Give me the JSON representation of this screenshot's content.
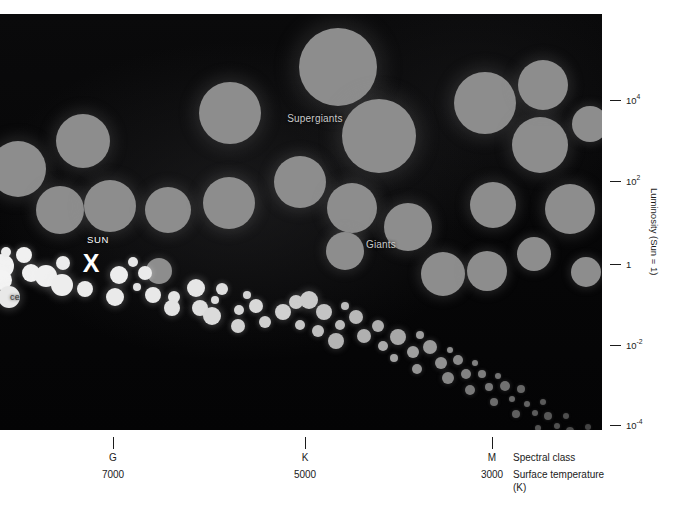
{
  "figure": {
    "background_color": "#050505",
    "page_background": "#ffffff"
  },
  "annotations": {
    "supergiants": "Supergiants",
    "giants": "Giants",
    "sun": "SUN",
    "sun_marker": "X",
    "main_sequence_clipped": "ce"
  },
  "y_axis": {
    "title": "Luminosity (Sun = 1)",
    "ticks": [
      {
        "label": "10",
        "exponent": "4",
        "y": 100
      },
      {
        "label": "10",
        "exponent": "2",
        "y": 181
      },
      {
        "label": "1",
        "exponent": "",
        "y": 264
      },
      {
        "label": "10",
        "exponent": "-2",
        "y": 345
      },
      {
        "label": "10",
        "exponent": "-4",
        "y": 425
      }
    ]
  },
  "x_axis": {
    "class_title": "Spectral class",
    "temp_title": "Surface temperature",
    "temp_unit": "(K)",
    "ticks": [
      {
        "spectral_class": "G",
        "temperature": "7000",
        "x": 113
      },
      {
        "spectral_class": "K",
        "temperature": "5000",
        "x": 305
      },
      {
        "spectral_class": "M",
        "temperature": "3000",
        "x": 492
      }
    ]
  },
  "chart_data": {
    "type": "scatter",
    "xlabel": "Spectral class / Surface temperature (K)",
    "ylabel": "Luminosity (Sun = 1)",
    "grid": false,
    "legend": "none",
    "x_tick_labels": [
      "G",
      "K",
      "M"
    ],
    "x_tick_temperatures": [
      7000,
      5000,
      3000
    ],
    "y_tick_labels": [
      "10^4",
      "10^2",
      "1",
      "10^-2",
      "10^-4"
    ],
    "series": [
      {
        "name": "Supergiants and Giants",
        "color": "#8d8d8d",
        "marker": "circle",
        "note": "Large grey discs in the upper half of the diagram; disc radius encodes stellar radius.",
        "points": [
          {
            "cx": 18,
            "cy": 155,
            "r": 28
          },
          {
            "cx": 83,
            "cy": 127,
            "r": 27
          },
          {
            "cx": 60,
            "cy": 196,
            "r": 24
          },
          {
            "cx": 110,
            "cy": 192,
            "r": 26
          },
          {
            "cx": 168,
            "cy": 196,
            "r": 23
          },
          {
            "cx": 230,
            "cy": 99,
            "r": 31
          },
          {
            "cx": 229,
            "cy": 189,
            "r": 26
          },
          {
            "cx": 159,
            "cy": 257,
            "r": 13
          },
          {
            "cx": 300,
            "cy": 168,
            "r": 26
          },
          {
            "cx": 338,
            "cy": 53,
            "r": 39
          },
          {
            "cx": 379,
            "cy": 122,
            "r": 37
          },
          {
            "cx": 352,
            "cy": 194,
            "r": 25
          },
          {
            "cx": 345,
            "cy": 237,
            "r": 19
          },
          {
            "cx": 408,
            "cy": 213,
            "r": 24
          },
          {
            "cx": 443,
            "cy": 260,
            "r": 22
          },
          {
            "cx": 485,
            "cy": 89,
            "r": 31
          },
          {
            "cx": 493,
            "cy": 191,
            "r": 23
          },
          {
            "cx": 487,
            "cy": 257,
            "r": 20
          },
          {
            "cx": 540,
            "cy": 131,
            "r": 28
          },
          {
            "cx": 543,
            "cy": 71,
            "r": 25
          },
          {
            "cx": 570,
            "cy": 195,
            "r": 25
          },
          {
            "cx": 534,
            "cy": 240,
            "r": 17
          },
          {
            "cx": 586,
            "cy": 258,
            "r": 15
          },
          {
            "cx": 590,
            "cy": 110,
            "r": 18
          }
        ]
      },
      {
        "name": "Main sequence",
        "color": "#efefef",
        "marker": "circle",
        "note": "Bright band of stars running from upper-left (hot, luminous) to lower-right (cool, faint); discs shrink and dim along the sequence.",
        "points": [
          {
            "cx": 2,
            "cy": 252,
            "r": 12,
            "c": "#f2f2f2"
          },
          {
            "cx": 6,
            "cy": 238,
            "r": 5,
            "c": "#ededed"
          },
          {
            "cx": 24,
            "cy": 241,
            "r": 8,
            "c": "#f0f0f0"
          },
          {
            "cx": 2,
            "cy": 266,
            "r": 10,
            "c": "#f4f4f4"
          },
          {
            "cx": 31,
            "cy": 259,
            "r": 9,
            "c": "#f1f1f1"
          },
          {
            "cx": 9,
            "cy": 283,
            "r": 11,
            "c": "#e8e8e8"
          },
          {
            "cx": 46,
            "cy": 262,
            "r": 11,
            "c": "#f0f0f0"
          },
          {
            "cx": 63,
            "cy": 249,
            "r": 7,
            "c": "#ececec"
          },
          {
            "cx": 62,
            "cy": 271,
            "r": 11,
            "c": "#ededed"
          },
          {
            "cx": 85,
            "cy": 275,
            "r": 8,
            "c": "#ebebeb"
          },
          {
            "cx": 119,
            "cy": 261,
            "r": 9,
            "c": "#ededed"
          },
          {
            "cx": 133,
            "cy": 248,
            "r": 5,
            "c": "#e7e7e7"
          },
          {
            "cx": 145,
            "cy": 259,
            "r": 7,
            "c": "#ebebeb"
          },
          {
            "cx": 137,
            "cy": 273,
            "r": 4,
            "c": "#e2e2e2"
          },
          {
            "cx": 115,
            "cy": 283,
            "r": 9,
            "c": "#eaeaea"
          },
          {
            "cx": 153,
            "cy": 281,
            "r": 8,
            "c": "#e8e8e8"
          },
          {
            "cx": 174,
            "cy": 283,
            "r": 6,
            "c": "#e4e4e4"
          },
          {
            "cx": 172,
            "cy": 294,
            "r": 8,
            "c": "#e3e3e3"
          },
          {
            "cx": 196,
            "cy": 274,
            "r": 9,
            "c": "#e6e6e6"
          },
          {
            "cx": 200,
            "cy": 294,
            "r": 8,
            "c": "#e0e0e0"
          },
          {
            "cx": 215,
            "cy": 286,
            "r": 4,
            "c": "#dcdcdc"
          },
          {
            "cx": 222,
            "cy": 275,
            "r": 6,
            "c": "#dedede"
          },
          {
            "cx": 212,
            "cy": 302,
            "r": 9,
            "c": "#dbdbdb"
          },
          {
            "cx": 239,
            "cy": 296,
            "r": 5,
            "c": "#d6d6d6"
          },
          {
            "cx": 247,
            "cy": 281,
            "r": 4,
            "c": "#d4d4d4"
          },
          {
            "cx": 256,
            "cy": 292,
            "r": 7,
            "c": "#d8d8d8"
          },
          {
            "cx": 238,
            "cy": 312,
            "r": 7,
            "c": "#d2d2d2"
          },
          {
            "cx": 265,
            "cy": 308,
            "r": 6,
            "c": "#cfcfcf"
          },
          {
            "cx": 283,
            "cy": 298,
            "r": 8,
            "c": "#d0d0d0"
          },
          {
            "cx": 296,
            "cy": 288,
            "r": 7,
            "c": "#cdcdcd"
          },
          {
            "cx": 309,
            "cy": 286,
            "r": 9,
            "c": "#cacaca"
          },
          {
            "cx": 300,
            "cy": 311,
            "r": 5,
            "c": "#c6c6c6"
          },
          {
            "cx": 324,
            "cy": 298,
            "r": 8,
            "c": "#c4c4c4"
          },
          {
            "cx": 318,
            "cy": 317,
            "r": 6,
            "c": "#bfbfbf"
          },
          {
            "cx": 340,
            "cy": 311,
            "r": 5,
            "c": "#bbbbbb"
          },
          {
            "cx": 345,
            "cy": 292,
            "r": 4,
            "c": "#bcbcbc"
          },
          {
            "cx": 356,
            "cy": 303,
            "r": 7,
            "c": "#b8b8b8"
          },
          {
            "cx": 336,
            "cy": 327,
            "r": 8,
            "c": "#b4b4b4"
          },
          {
            "cx": 364,
            "cy": 322,
            "r": 7,
            "c": "#b0b0b0"
          },
          {
            "cx": 378,
            "cy": 312,
            "r": 6,
            "c": "#aeaeae"
          },
          {
            "cx": 383,
            "cy": 332,
            "r": 5,
            "c": "#aaaaaa"
          },
          {
            "cx": 398,
            "cy": 323,
            "r": 8,
            "c": "#a7a7a7"
          },
          {
            "cx": 394,
            "cy": 344,
            "r": 4,
            "c": "#a2a2a2"
          },
          {
            "cx": 413,
            "cy": 338,
            "r": 6,
            "c": "#9f9f9f"
          },
          {
            "cx": 420,
            "cy": 321,
            "r": 4,
            "c": "#9d9d9d"
          },
          {
            "cx": 430,
            "cy": 333,
            "r": 7,
            "c": "#9a9a9a"
          },
          {
            "cx": 417,
            "cy": 355,
            "r": 5,
            "c": "#949494"
          },
          {
            "cx": 441,
            "cy": 349,
            "r": 6,
            "c": "#919191"
          },
          {
            "cx": 450,
            "cy": 336,
            "r": 3,
            "c": "#8d8d8d"
          },
          {
            "cx": 458,
            "cy": 346,
            "r": 5,
            "c": "#8a8a8a"
          },
          {
            "cx": 448,
            "cy": 364,
            "r": 6,
            "c": "#868686"
          },
          {
            "cx": 466,
            "cy": 360,
            "r": 5,
            "c": "#838383"
          },
          {
            "cx": 475,
            "cy": 349,
            "r": 3,
            "c": "#808080"
          },
          {
            "cx": 482,
            "cy": 360,
            "r": 4,
            "c": "#7d7d7d"
          },
          {
            "cx": 470,
            "cy": 376,
            "r": 5,
            "c": "#797979"
          },
          {
            "cx": 489,
            "cy": 373,
            "r": 4,
            "c": "#767676"
          },
          {
            "cx": 498,
            "cy": 362,
            "r": 3,
            "c": "#737373"
          },
          {
            "cx": 505,
            "cy": 372,
            "r": 5,
            "c": "#707070"
          },
          {
            "cx": 494,
            "cy": 388,
            "r": 4,
            "c": "#6c6c6c"
          },
          {
            "cx": 512,
            "cy": 385,
            "r": 3,
            "c": "#696969"
          },
          {
            "cx": 521,
            "cy": 375,
            "r": 4,
            "c": "#666666"
          },
          {
            "cx": 527,
            "cy": 390,
            "r": 3,
            "c": "#636363"
          },
          {
            "cx": 516,
            "cy": 400,
            "r": 4,
            "c": "#5f5f5f"
          },
          {
            "cx": 535,
            "cy": 399,
            "r": 3,
            "c": "#5c5c5c"
          },
          {
            "cx": 543,
            "cy": 388,
            "r": 3,
            "c": "#5a5a5a"
          },
          {
            "cx": 548,
            "cy": 402,
            "r": 4,
            "c": "#575757"
          },
          {
            "cx": 538,
            "cy": 414,
            "r": 3,
            "c": "#535353"
          },
          {
            "cx": 557,
            "cy": 412,
            "r": 3,
            "c": "#505050"
          },
          {
            "cx": 566,
            "cy": 402,
            "r": 3,
            "c": "#4e4e4e"
          },
          {
            "cx": 570,
            "cy": 417,
            "r": 4,
            "c": "#4b4b4b"
          },
          {
            "cx": 560,
            "cy": 424,
            "r": 3,
            "c": "#474747"
          },
          {
            "cx": 580,
            "cy": 423,
            "r": 3,
            "c": "#454545"
          },
          {
            "cx": 588,
            "cy": 413,
            "r": 3,
            "c": "#434343"
          },
          {
            "cx": 594,
            "cy": 425,
            "r": 3,
            "c": "#414141"
          }
        ]
      }
    ]
  }
}
